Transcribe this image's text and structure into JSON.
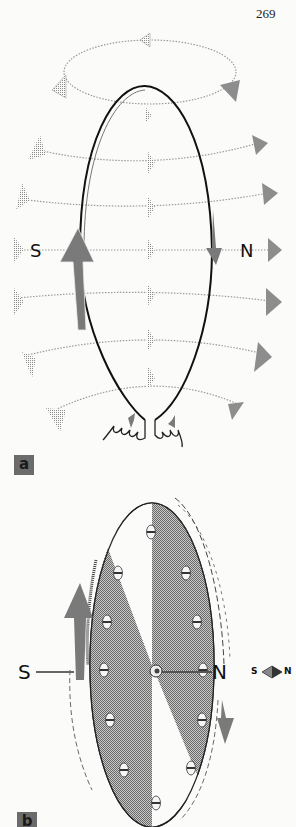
{
  "page": {
    "number": "269"
  },
  "figure_a": {
    "label": "a",
    "poles": {
      "south": "S",
      "north": "N"
    },
    "description": "current loop with magnetic field lines",
    "field_line_color": "#9a9a9a",
    "arrow_color": "#7a7a7a"
  },
  "figure_b": {
    "label": "b",
    "poles": {
      "south": "S",
      "north": "N"
    },
    "compass": {
      "south": "S",
      "north": "N"
    },
    "description": "rotating disk with magnetized segments",
    "disk_fill": "#a8a8a8",
    "arrow_color": "#7a7a7a"
  }
}
